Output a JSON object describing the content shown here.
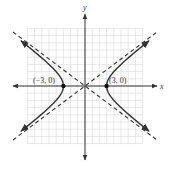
{
  "chart_data": {
    "type": "line",
    "title": "",
    "xlabel": "x",
    "ylabel": "y",
    "xlim": [
      -8,
      8
    ],
    "ylim": [
      -8,
      8
    ],
    "grid": true,
    "hyperbola": {
      "equation_form": "x^2/a^2 - y^2/b^2 = 1",
      "center": [
        0,
        0
      ],
      "a": 3,
      "b": 2.25,
      "orientation": "horizontal"
    },
    "asymptotes": [
      {
        "name": "asymptote-positive",
        "slope": 0.75,
        "intercept": 0,
        "style": "dashed"
      },
      {
        "name": "asymptote-negative",
        "slope": -0.75,
        "intercept": 0,
        "style": "dashed"
      }
    ],
    "points": [
      {
        "name": "vertex-left",
        "x": -3,
        "y": 0,
        "label": "(−3, 0)"
      },
      {
        "name": "vertex-right",
        "x": 3,
        "y": 0,
        "label": "(3, 0)"
      }
    ],
    "colors": {
      "curve": "#333333",
      "grid": "#d9d9d9",
      "axis": "#333333"
    }
  }
}
